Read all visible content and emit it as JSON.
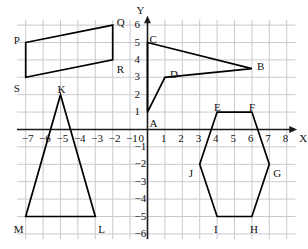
{
  "figure": {
    "axis_x_name": "X",
    "axis_y_name": "Y",
    "grid_color": "#c9c9cf",
    "axis_color": "#1a1a1a",
    "shape_color": "#000000",
    "background": "#ffffff"
  },
  "chart_data": {
    "type": "scatter",
    "xlabel": "X",
    "ylabel": "Y",
    "xlim": [
      -7.6,
      8.6
    ],
    "ylim": [
      -6.4,
      6.4
    ],
    "grid": true,
    "legend": "none",
    "x_ticks": [
      -7,
      -6,
      -5,
      -4,
      -3,
      -2,
      -1,
      0,
      1,
      2,
      3,
      4,
      5,
      6,
      7,
      8
    ],
    "y_ticks": [
      6,
      5,
      4,
      3,
      2,
      1,
      -1,
      -2,
      -3,
      -4,
      -5,
      -6
    ],
    "x_tick_labels": [
      "−7",
      "−6",
      "−5",
      "−4",
      "−3",
      "−2",
      "−1",
      "0",
      "1",
      "2",
      "3",
      "4",
      "5",
      "6",
      "7",
      "8"
    ],
    "y_tick_labels": [
      "6",
      "5",
      "4",
      "3",
      "2",
      "1",
      "−1",
      "−2",
      "−3",
      "−4",
      "−5",
      "−6"
    ],
    "shapes": [
      {
        "name": "parallelogram-pqrs",
        "vertices": [
          {
            "label": "P",
            "x": -7,
            "y": 5
          },
          {
            "label": "Q",
            "x": -2,
            "y": 6
          },
          {
            "label": "R",
            "x": -2,
            "y": 4
          },
          {
            "label": "S",
            "x": -7,
            "y": 3
          }
        ],
        "label_offsets": [
          {
            "dx": -12,
            "dy": -2
          },
          {
            "dx": 4,
            "dy": -2
          },
          {
            "dx": 4,
            "dy": 10
          },
          {
            "dx": -12,
            "dy": 12
          }
        ]
      },
      {
        "name": "triangle-klm",
        "vertices": [
          {
            "label": "K",
            "x": -5,
            "y": 2
          },
          {
            "label": "L",
            "x": -3,
            "y": -5
          },
          {
            "label": "M",
            "x": -7,
            "y": -5
          }
        ],
        "label_offsets": [
          {
            "dx": -3,
            "dy": -5
          },
          {
            "dx": 3,
            "dy": 13
          },
          {
            "dx": -12,
            "dy": 13
          }
        ]
      },
      {
        "name": "arrow-acdb",
        "vertices": [
          {
            "label": "A",
            "x": 0,
            "y": 1
          },
          {
            "label": "C",
            "x": 0,
            "y": 5
          },
          {
            "label": "B",
            "x": 6,
            "y": 3.5
          },
          {
            "label": "D",
            "x": 1,
            "y": 3
          }
        ],
        "path_order": [
          "A",
          "C",
          "B",
          "D"
        ],
        "label_offsets": [
          {
            "dx": 2,
            "dy": 12
          },
          {
            "dx": 2,
            "dy": -3
          },
          {
            "dx": 5,
            "dy": -2
          },
          {
            "dx": 5,
            "dy": -2
          }
        ]
      },
      {
        "name": "hexagon-efghij",
        "vertices": [
          {
            "label": "E",
            "x": 4,
            "y": 1
          },
          {
            "label": "F",
            "x": 6,
            "y": 1
          },
          {
            "label": "G",
            "x": 7,
            "y": -2
          },
          {
            "label": "H",
            "x": 6,
            "y": -5
          },
          {
            "label": "I",
            "x": 4,
            "y": -5
          },
          {
            "label": "J",
            "x": 3,
            "y": -2
          }
        ],
        "label_offsets": [
          {
            "dx": -3,
            "dy": -4
          },
          {
            "dx": -3,
            "dy": -4
          },
          {
            "dx": 4,
            "dy": 10
          },
          {
            "dx": -2,
            "dy": 13
          },
          {
            "dx": -3,
            "dy": 13
          },
          {
            "dx": -11,
            "dy": 10
          }
        ]
      }
    ]
  }
}
